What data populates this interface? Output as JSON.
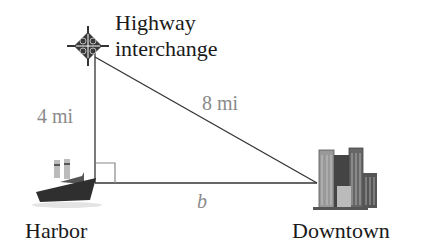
{
  "diagram": {
    "type": "right-triangle word problem",
    "vertices": {
      "top": {
        "label_line1": "Highway",
        "label_line2": "interchange",
        "icon": "interchange-icon"
      },
      "bottom_left": {
        "label": "Harbor",
        "icon": "ship-icon"
      },
      "bottom_right": {
        "label": "Downtown",
        "icon": "city-skyline-icon"
      }
    },
    "sides": {
      "vertical_leg": "4 mi",
      "hypotenuse": "8 mi",
      "horizontal_leg": "b"
    },
    "right_angle_at": "bottom_left",
    "colors": {
      "line": "#333333",
      "measure_text": "#8a8a8a",
      "label_text": "#1a1a1a",
      "right_angle_box": "#888888"
    }
  }
}
